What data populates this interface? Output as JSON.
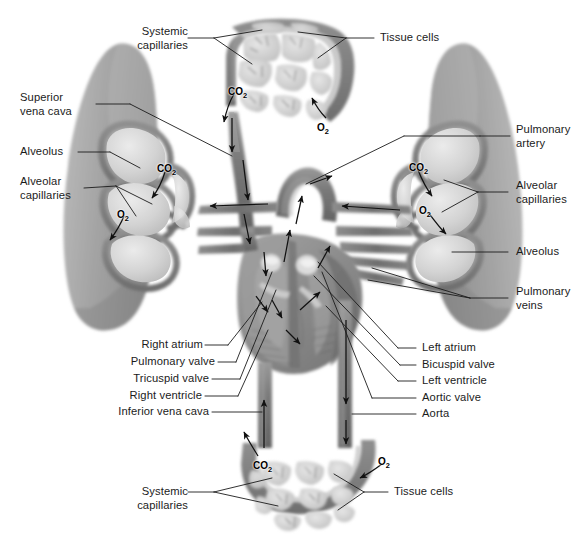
{
  "figure": {
    "background_color": "#ffffff",
    "ink_color": "#1b1b1b",
    "width": 586,
    "height": 551
  },
  "labels": {
    "systemic_capillaries_top": "Systemic\ncapillaries",
    "tissue_cells_top": "Tissue cells",
    "superior_vena_cava": "Superior\nvena cava",
    "alveolus_left": "Alveolus",
    "alveolar_capillaries_left": "Alveolar\ncapillaries",
    "pulmonary_artery": "Pulmonary\nartery",
    "alveolar_capillaries_right": "Alveolar\ncapillaries",
    "alveolus_right": "Alveolus",
    "pulmonary_veins": "Pulmonary\nveins",
    "right_atrium": "Right atrium",
    "pulmonary_valve": "Pulmonary valve",
    "tricuspid_valve": "Tricuspid valve",
    "right_ventricle": "Right ventricle",
    "inferior_vena_cava": "Inferior vena cava",
    "left_atrium": "Left atrium",
    "bicuspid_valve": "Bicuspid valve",
    "left_ventricle": "Left ventricle",
    "aortic_valve": "Aortic valve",
    "aorta": "Aorta",
    "systemic_capillaries_bottom": "Systemic\ncapillaries",
    "tissue_cells_bottom": "Tissue cells"
  },
  "gas_labels": {
    "co2": "CO",
    "co2_sub": "2",
    "o2": "O",
    "o2_sub": "2",
    "instances": [
      {
        "name": "co2-top-capillary",
        "gas": "CO2",
        "x": 228,
        "y": 86
      },
      {
        "name": "o2-top-capillary",
        "gas": "O2",
        "x": 317,
        "y": 122
      },
      {
        "name": "co2-left-lung",
        "gas": "CO2",
        "x": 157,
        "y": 163
      },
      {
        "name": "o2-left-lung",
        "gas": "O2",
        "x": 117,
        "y": 209
      },
      {
        "name": "co2-right-lung",
        "gas": "CO2",
        "x": 409,
        "y": 162
      },
      {
        "name": "o2-right-lung",
        "gas": "O2",
        "x": 419,
        "y": 205
      },
      {
        "name": "co2-bottom-capillary",
        "gas": "CO2",
        "x": 253,
        "y": 460
      },
      {
        "name": "o2-bottom-capillary",
        "gas": "O2",
        "x": 378,
        "y": 456
      }
    ]
  },
  "anatomy_colors": {
    "lung_tissue": "#a9a9a9",
    "lung_tissue_dark": "#8e8e8e",
    "vessel_dark": "#6d6d6d",
    "vessel_mid": "#8a8a8a",
    "alveolus_lumen": "#d6d6d6",
    "capillary_wall": "#7d7d7d",
    "tissue_cell": "#c9c9c9",
    "heart_muscle": "#8b8b8b",
    "heart_chamber": "#9d9d9d",
    "arrow": "#111111"
  }
}
